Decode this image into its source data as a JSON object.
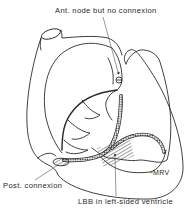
{
  "diagram": {
    "type": "anatomical-line-drawing",
    "labels": {
      "ant_node": "Ant. node but no connexion",
      "post_connexion": "Post. connexion",
      "lbb": "LBB in left-sided ventricle",
      "mrv": "MRV"
    },
    "colors": {
      "line": "#2a2a2a",
      "background": "#ffffff"
    }
  }
}
